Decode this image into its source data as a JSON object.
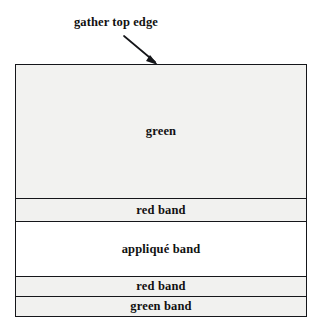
{
  "diagram": {
    "title_caption": "gather top edge",
    "panel": {
      "bands": [
        {
          "id": "green-main",
          "label": "green",
          "fill": "#f2f2f0"
        },
        {
          "id": "red-upper",
          "label": "red band",
          "fill": "#f1f1ef"
        },
        {
          "id": "applique",
          "label": "appliqué band",
          "fill": "#ffffff"
        },
        {
          "id": "red-lower",
          "label": "red band",
          "fill": "#f1f1ef"
        },
        {
          "id": "green-lower",
          "label": "green band",
          "fill": "#f1f1ef"
        }
      ]
    },
    "colors": {
      "outline": "#15161a",
      "text": "#111111",
      "page_background": "#ffffff"
    }
  }
}
